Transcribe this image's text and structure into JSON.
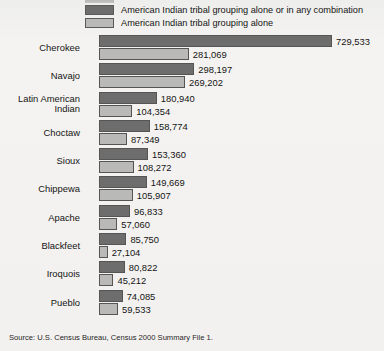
{
  "legend": {
    "position": "top",
    "items": [
      {
        "label": "American Indian tribal grouping alone or in any combination",
        "swatch": "dark-gray-swatch",
        "color": "#6d6d6d"
      },
      {
        "label": "American Indian tribal grouping alone",
        "swatch": "light-gray-swatch",
        "color": "#b9b9b7"
      }
    ]
  },
  "source": {
    "text": "Source: U.S. Census Bureau, Census 2000 Summary File 1."
  },
  "chart_data": {
    "type": "bar",
    "orientation": "horizontal",
    "title": "",
    "subtitle": "",
    "xlabel": "",
    "ylabel": "",
    "grid": false,
    "legend_position": "top",
    "axis_baseline_value": 0,
    "xlim": [
      0,
      729533
    ],
    "categories": [
      "Cherokee",
      "Navajo",
      "Latin American Indian",
      "Choctaw",
      "Sioux",
      "Chippewa",
      "Apache",
      "Blackfeet",
      "Iroquois",
      "Pueblo"
    ],
    "category_lines": [
      [
        "Cherokee"
      ],
      [
        "Navajo"
      ],
      [
        "Latin American",
        "Indian"
      ],
      [
        "Choctaw"
      ],
      [
        "Sioux"
      ],
      [
        "Chippewa"
      ],
      [
        "Apache"
      ],
      [
        "Blackfeet"
      ],
      [
        "Iroquois"
      ],
      [
        "Pueblo"
      ]
    ],
    "series": [
      {
        "name": "American Indian tribal grouping alone or in any combination",
        "color": "#6d6d6d",
        "values": [
          729533,
          298197,
          180940,
          158774,
          153360,
          149669,
          96833,
          85750,
          80822,
          74085
        ],
        "labels": [
          "729,533",
          "298,197",
          "180,940",
          "158,774",
          "153,360",
          "149,669",
          "96,833",
          "85,750",
          "80,822",
          "74,085"
        ]
      },
      {
        "name": "American Indian tribal grouping alone",
        "color": "#b9b9b7",
        "values": [
          281069,
          269202,
          104354,
          87349,
          108272,
          105907,
          57060,
          27104,
          45212,
          59533
        ],
        "labels": [
          "281,069",
          "269,202",
          "104,354",
          "87,349",
          "108,272",
          "105,907",
          "57,060",
          "27,104",
          "45,212",
          "59,533"
        ]
      }
    ]
  }
}
